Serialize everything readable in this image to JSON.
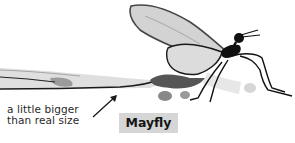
{
  "illustration": {
    "subject": "mayfly",
    "style": "ink-wash drawing",
    "colors": {
      "ink": "#151515",
      "wash": "#bdbdbd",
      "label_bg": "#d6d6d6",
      "background": "#ffffff"
    }
  },
  "caption": {
    "line1": "a little bigger",
    "line2": "than real size"
  },
  "label": {
    "text": "Mayfly"
  },
  "annotation": {
    "arrow_icon": "arrow-up-right"
  }
}
